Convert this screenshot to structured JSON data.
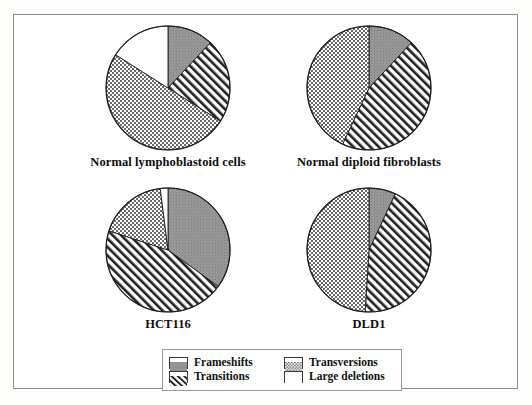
{
  "figure": {
    "caption_font_note": "",
    "background": "#ffffff",
    "frame_color": "#8d8d8d"
  },
  "legend": {
    "items": [
      {
        "label": "Frameshifts",
        "pattern": "solid-gray",
        "color": "#8a8a8a"
      },
      {
        "label": "Transversions",
        "pattern": "stipple-dot",
        "color": "#ffffff"
      },
      {
        "label": "Transitions",
        "pattern": "diagonal-stripe",
        "color": "#ffffff"
      },
      {
        "label": "Large deletions",
        "pattern": "plain-white",
        "color": "#ffffff"
      }
    ]
  },
  "chart_data": [
    {
      "type": "pie",
      "title": "Normal lymphoblastoid cells",
      "categories": [
        "Frameshifts",
        "Transitions",
        "Transversions",
        "Large deletions"
      ],
      "values": [
        12,
        22,
        50,
        16
      ],
      "units": "percent",
      "start_angle_deg": 0,
      "legend_position": "bottom-shared"
    },
    {
      "type": "pie",
      "title": "Normal diploid fibroblasts",
      "categories": [
        "Frameshifts",
        "Transitions",
        "Transversions",
        "Large deletions"
      ],
      "values": [
        12,
        45,
        43,
        0
      ],
      "units": "percent",
      "start_angle_deg": 0,
      "legend_position": "bottom-shared"
    },
    {
      "type": "pie",
      "title": "HCT116",
      "categories": [
        "Frameshifts",
        "Transitions",
        "Transversions",
        "Large deletions"
      ],
      "values": [
        35,
        45,
        18,
        2
      ],
      "units": "percent",
      "start_angle_deg": 0,
      "legend_position": "bottom-shared"
    },
    {
      "type": "pie",
      "title": "DLD1",
      "categories": [
        "Frameshifts",
        "Transitions",
        "Transversions",
        "Large deletions"
      ],
      "values": [
        7,
        44,
        49,
        0
      ],
      "units": "percent",
      "start_angle_deg": 0,
      "legend_position": "bottom-shared"
    }
  ]
}
